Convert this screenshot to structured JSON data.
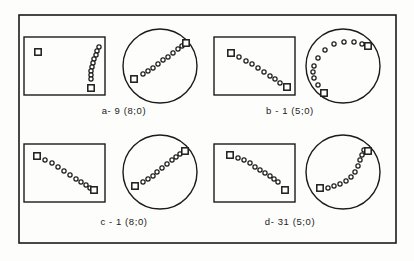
{
  "figure": {
    "kind": "scientific-figure-scan",
    "background_color": "#fdfdfc",
    "ink_color": "#1b1b1b",
    "frame": {
      "x": 19,
      "y": 15,
      "width": 377,
      "height": 228
    },
    "panels": [
      {
        "id": "a",
        "caption": "a- 9 (8;0)",
        "caption_x": 124,
        "caption_y": 114,
        "rect_plot": {
          "x": 24,
          "y": 37,
          "width": 81,
          "height": 58,
          "squares": [
            {
              "x": 38,
              "y": 52
            },
            {
              "x": 91,
              "y": 88
            }
          ],
          "circles": [
            {
              "x": 99,
              "y": 47
            },
            {
              "x": 97,
              "y": 51
            },
            {
              "x": 96,
              "y": 55
            },
            {
              "x": 94,
              "y": 59
            },
            {
              "x": 93,
              "y": 63
            },
            {
              "x": 92,
              "y": 67
            },
            {
              "x": 91,
              "y": 71
            },
            {
              "x": 91,
              "y": 75
            },
            {
              "x": 91,
              "y": 79
            }
          ]
        },
        "circle_plot": {
          "cx": 160,
          "cy": 66,
          "r": 37,
          "squares": [
            {
              "x": 134,
              "y": 79
            },
            {
              "x": 186,
              "y": 43
            }
          ],
          "circles": [
            {
              "x": 143,
              "y": 74
            },
            {
              "x": 148,
              "y": 71
            },
            {
              "x": 153,
              "y": 68
            },
            {
              "x": 158,
              "y": 64
            },
            {
              "x": 163,
              "y": 60
            },
            {
              "x": 168,
              "y": 57
            },
            {
              "x": 173,
              "y": 53
            },
            {
              "x": 178,
              "y": 49
            },
            {
              "x": 182,
              "y": 46
            }
          ]
        }
      },
      {
        "id": "b",
        "caption": "b -  1 (5;0)",
        "caption_x": 290,
        "caption_y": 114,
        "rect_plot": {
          "x": 214,
          "y": 37,
          "width": 81,
          "height": 58,
          "squares": [
            {
              "x": 231,
              "y": 53
            },
            {
              "x": 287,
              "y": 87
            }
          ],
          "circles": [
            {
              "x": 239,
              "y": 57
            },
            {
              "x": 246,
              "y": 61
            },
            {
              "x": 252,
              "y": 64
            },
            {
              "x": 258,
              "y": 68
            },
            {
              "x": 264,
              "y": 72
            },
            {
              "x": 270,
              "y": 76
            },
            {
              "x": 275,
              "y": 79
            },
            {
              "x": 280,
              "y": 83
            }
          ]
        },
        "circle_plot": {
          "cx": 343,
          "cy": 66,
          "r": 37,
          "squares": [
            {
              "x": 324,
              "y": 93
            },
            {
              "x": 368,
              "y": 46
            }
          ],
          "circles": [
            {
              "x": 318,
              "y": 85
            },
            {
              "x": 314,
              "y": 78
            },
            {
              "x": 313,
              "y": 72
            },
            {
              "x": 314,
              "y": 66
            },
            {
              "x": 318,
              "y": 58
            },
            {
              "x": 325,
              "y": 50
            },
            {
              "x": 334,
              "y": 44
            },
            {
              "x": 344,
              "y": 42
            },
            {
              "x": 354,
              "y": 42
            },
            {
              "x": 362,
              "y": 44
            }
          ]
        }
      },
      {
        "id": "c",
        "caption": "c -  1 (8;0)",
        "caption_x": 124,
        "caption_y": 225,
        "rect_plot": {
          "x": 24,
          "y": 144,
          "width": 81,
          "height": 58,
          "squares": [
            {
              "x": 37,
              "y": 156
            },
            {
              "x": 94,
              "y": 190
            }
          ],
          "circles": [
            {
              "x": 45,
              "y": 160
            },
            {
              "x": 52,
              "y": 163
            },
            {
              "x": 58,
              "y": 167
            },
            {
              "x": 64,
              "y": 171
            },
            {
              "x": 70,
              "y": 175
            },
            {
              "x": 76,
              "y": 179
            },
            {
              "x": 81,
              "y": 182
            },
            {
              "x": 86,
              "y": 185
            },
            {
              "x": 90,
              "y": 188
            }
          ]
        },
        "circle_plot": {
          "cx": 160,
          "cy": 172,
          "r": 37,
          "squares": [
            {
              "x": 135,
              "y": 186
            },
            {
              "x": 185,
              "y": 151
            }
          ],
          "circles": [
            {
              "x": 143,
              "y": 182
            },
            {
              "x": 148,
              "y": 179
            },
            {
              "x": 153,
              "y": 176
            },
            {
              "x": 157,
              "y": 172
            },
            {
              "x": 162,
              "y": 168
            },
            {
              "x": 167,
              "y": 164
            },
            {
              "x": 172,
              "y": 160
            },
            {
              "x": 176,
              "y": 157
            },
            {
              "x": 180,
              "y": 154
            }
          ]
        }
      },
      {
        "id": "d",
        "caption": "d-  31 (5;0)",
        "caption_x": 290,
        "caption_y": 225,
        "rect_plot": {
          "x": 214,
          "y": 144,
          "width": 81,
          "height": 58,
          "squares": [
            {
              "x": 230,
              "y": 155
            },
            {
              "x": 285,
              "y": 190
            }
          ],
          "circles": [
            {
              "x": 238,
              "y": 158
            },
            {
              "x": 244,
              "y": 160
            },
            {
              "x": 250,
              "y": 163
            },
            {
              "x": 255,
              "y": 167
            },
            {
              "x": 260,
              "y": 170
            },
            {
              "x": 265,
              "y": 173
            },
            {
              "x": 270,
              "y": 176
            },
            {
              "x": 274,
              "y": 179
            },
            {
              "x": 278,
              "y": 182
            }
          ]
        },
        "circle_plot": {
          "cx": 343,
          "cy": 172,
          "r": 37,
          "squares": [
            {
              "x": 320,
              "y": 188
            },
            {
              "x": 368,
              "y": 151
            }
          ],
          "circles": [
            {
              "x": 328,
              "y": 188
            },
            {
              "x": 334,
              "y": 186
            },
            {
              "x": 340,
              "y": 184
            },
            {
              "x": 346,
              "y": 181
            },
            {
              "x": 351,
              "y": 177
            },
            {
              "x": 355,
              "y": 172
            },
            {
              "x": 358,
              "y": 166
            },
            {
              "x": 360,
              "y": 160
            },
            {
              "x": 362,
              "y": 155
            },
            {
              "x": 364,
              "y": 150
            }
          ]
        }
      }
    ],
    "marker_legend": {
      "square_name": "endpoint-square-marker",
      "circle_name": "data-circle-marker"
    }
  }
}
